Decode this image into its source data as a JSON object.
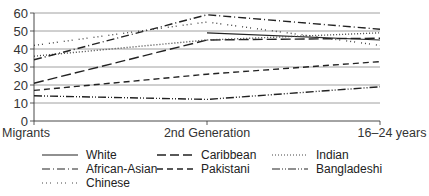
{
  "chart_data": {
    "type": "line",
    "title": "",
    "xlabel": "",
    "ylabel": "",
    "ylim": [
      0,
      60
    ],
    "yticks": [
      0,
      10,
      20,
      30,
      40,
      50,
      60
    ],
    "grid": true,
    "legend_position": "bottom",
    "x": [
      "Migrants",
      "2nd Generation",
      "16–24 years"
    ],
    "series": [
      {
        "name": "White",
        "values": [
          null,
          49,
          45
        ],
        "dash": "solid"
      },
      {
        "name": "Caribbean",
        "values": [
          21,
          45,
          46
        ],
        "dash": "longdash"
      },
      {
        "name": "Indian",
        "values": [
          36,
          45,
          49
        ],
        "dash": "dot"
      },
      {
        "name": "African-Asian",
        "values": [
          34,
          59,
          51
        ],
        "dash": "dashdot"
      },
      {
        "name": "Pakistani",
        "values": [
          17,
          26,
          33
        ],
        "dash": "dash"
      },
      {
        "name": "Bangladeshi",
        "values": [
          14,
          12,
          19
        ],
        "dash": "dashdotdot"
      },
      {
        "name": "Chinese",
        "values": [
          42,
          55,
          42
        ],
        "dash": "sparsedot"
      }
    ]
  },
  "legend": {
    "items": [
      {
        "label": "White"
      },
      {
        "label": "Caribbean"
      },
      {
        "label": "Indian"
      },
      {
        "label": "African-Asian"
      },
      {
        "label": "Pakistani"
      },
      {
        "label": "Bangladeshi"
      },
      {
        "label": "Chinese"
      }
    ]
  }
}
